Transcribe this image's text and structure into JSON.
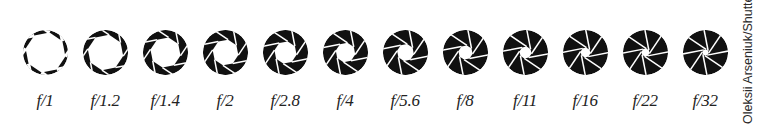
{
  "colors": {
    "blade": "#111111",
    "background": "#ffffff",
    "label": "#222222",
    "credit": "#2a2a2a"
  },
  "icon_type": "aperture-icon",
  "stops": [
    {
      "label": "f/1",
      "opening": 0.9
    },
    {
      "label": "f/1.2",
      "opening": 0.8
    },
    {
      "label": "f/1.4",
      "opening": 0.68
    },
    {
      "label": "f/2",
      "opening": 0.58
    },
    {
      "label": "f/2.8",
      "opening": 0.5
    },
    {
      "label": "f/4",
      "opening": 0.44
    },
    {
      "label": "f/5.6",
      "opening": 0.38
    },
    {
      "label": "f/8",
      "opening": 0.32
    },
    {
      "label": "f/11",
      "opening": 0.27
    },
    {
      "label": "f/16",
      "opening": 0.22
    },
    {
      "label": "f/22",
      "opening": 0.18
    },
    {
      "label": "f/32",
      "opening": 0.14
    }
  ],
  "credit": "Oleksii Arseniuk/Shutters"
}
